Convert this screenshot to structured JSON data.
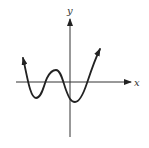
{
  "figure": {
    "type": "polynomial-graph",
    "axes": {
      "x_label": "x",
      "y_label": "y"
    },
    "curve": {
      "description": "Graph of a polynomial with 4 x-intercepts, rising at both ends",
      "end_behavior": "up-left, up-right",
      "turning_points": 3,
      "x_intercepts": 4
    },
    "colors": {
      "axis": "#333333",
      "curve": "#222222",
      "background": "#ffffff"
    }
  }
}
